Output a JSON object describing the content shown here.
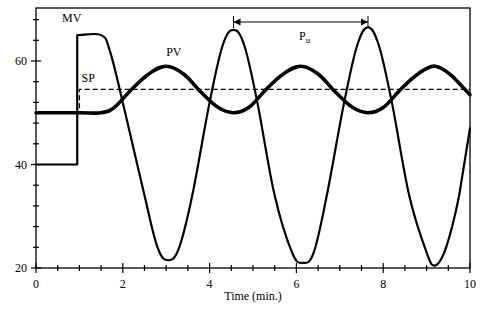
{
  "chart_data": {
    "type": "line",
    "title": "",
    "xlabel": "Time (min.)",
    "ylabel": "",
    "xlim": [
      0,
      10
    ],
    "ylim": [
      20,
      70
    ],
    "xticks": [
      0,
      2,
      4,
      6,
      8,
      10
    ],
    "xtick_labels": [
      "0",
      "2",
      "4",
      "6",
      "8",
      "10"
    ],
    "yticks": [
      20,
      40,
      60
    ],
    "ytick_labels": [
      "20",
      "40",
      "60"
    ],
    "minor_xtick_step": 0.5,
    "minor_ytick_step": 4,
    "grid": false,
    "legend": "inline labels",
    "series": [
      {
        "name": "MV",
        "label": "MV",
        "style": "solid-thin",
        "x": [
          0,
          0.95,
          0.95,
          1.0,
          1.5,
          1.7,
          2.0,
          2.5,
          2.8,
          3.05,
          3.3,
          3.6,
          4.0,
          4.3,
          4.55,
          4.8,
          5.1,
          5.5,
          5.9,
          6.15,
          6.4,
          6.7,
          7.1,
          7.4,
          7.65,
          7.9,
          8.2,
          8.6,
          9.0,
          9.2,
          9.45,
          9.75,
          10.0
        ],
        "y": [
          40,
          40,
          65,
          65,
          65,
          62,
          52,
          34,
          24,
          21.5,
          24,
          34,
          52,
          63,
          66,
          63,
          52,
          34,
          23,
          21,
          23,
          34,
          52,
          63,
          66.5,
          63,
          52,
          34,
          23,
          20.5,
          24,
          34,
          47
        ]
      },
      {
        "name": "PV",
        "label": "PV",
        "style": "solid-thick",
        "x": [
          0,
          1.0,
          1.5,
          1.8,
          2.2,
          2.6,
          3.0,
          3.4,
          3.8,
          4.2,
          4.55,
          4.9,
          5.3,
          5.7,
          6.1,
          6.5,
          6.9,
          7.3,
          7.65,
          8.0,
          8.4,
          8.8,
          9.2,
          9.6,
          10.0
        ],
        "y": [
          50,
          50,
          50,
          51,
          54.5,
          57.5,
          59,
          57.5,
          54,
          51,
          50,
          51,
          54.5,
          57.5,
          59,
          57.5,
          54,
          51,
          50,
          51,
          54.5,
          57.5,
          59,
          57,
          53.5
        ]
      },
      {
        "name": "SP",
        "label": "SP",
        "style": "dashed",
        "x": [
          0,
          1.0,
          1.0,
          10.0
        ],
        "y": [
          50,
          50,
          54.5,
          54.5
        ]
      }
    ],
    "annotations": [
      {
        "text": "MV",
        "x": 1.05,
        "y": 67.5
      },
      {
        "text": "PV",
        "x": 3.0,
        "y": 61
      },
      {
        "text": "SP",
        "x": 1.05,
        "y": 56
      },
      {
        "text": "P",
        "subscript": "u",
        "type": "double-arrow",
        "x_start": 4.55,
        "x_end": 7.65,
        "y": 69.8,
        "label_x": 6.2,
        "label_y": 66.5
      }
    ]
  }
}
